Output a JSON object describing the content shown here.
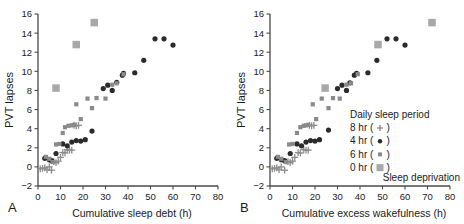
{
  "figure": {
    "background": "#ffffff",
    "axis_color": "#4a4a4a",
    "text_color": "#1a1a1a"
  },
  "series_styles": {
    "8hr": {
      "label": "8 hr",
      "marker": "plus",
      "color": "#8c8c8c",
      "size": 3.4
    },
    "4hr": {
      "label": "4 hr",
      "marker": "circle",
      "color": "#2b2b2b",
      "size": 2.6
    },
    "6hr": {
      "label": "6 hr",
      "marker": "square",
      "color": "#8a8a8a",
      "size": 4.2
    },
    "0hr": {
      "label": "0 hr",
      "marker": "square",
      "color": "#a8a8a8",
      "size": 7.5
    }
  },
  "panel_a": {
    "letter": "A",
    "chart_data": {
      "type": "scatter",
      "title": "",
      "xlabel": "Cumulative sleep debt (h)",
      "ylabel": "PVT lapses",
      "xlim": [
        0,
        80
      ],
      "ylim": [
        -2,
        16
      ],
      "xticks": [
        0,
        10,
        20,
        30,
        40,
        50,
        60,
        70,
        80
      ],
      "yticks": [
        -2,
        0,
        2,
        4,
        6,
        8,
        10,
        12,
        14,
        16
      ],
      "grid": false,
      "legend": "none",
      "series": [
        {
          "name": "8 hr",
          "marker": "plus",
          "color": "#8c8c8c",
          "points": [
            [
              1.0,
              -0.2
            ],
            [
              2.0,
              -0.15
            ],
            [
              3.0,
              -0.1
            ],
            [
              4.0,
              -0.3
            ],
            [
              5.0,
              0.0
            ],
            [
              6.0,
              -0.35
            ],
            [
              7.0,
              0.55
            ],
            [
              8.0,
              0.45
            ],
            [
              9.0,
              0.6
            ],
            [
              10.0,
              1.0
            ],
            [
              11.0,
              1.5
            ],
            [
              12.0,
              1.45
            ],
            [
              13.0,
              1.8
            ],
            [
              14.0,
              1.75
            ],
            [
              15.0,
              1.75
            ],
            [
              16.0,
              4.35
            ],
            [
              17.0,
              4.3
            ],
            [
              18.0,
              4.35
            ]
          ]
        },
        {
          "name": "4 hr",
          "marker": "circle",
          "color": "#2b2b2b",
          "points": [
            [
              3.0,
              0.9
            ],
            [
              5.0,
              0.75
            ],
            [
              6.0,
              0.65
            ],
            [
              8.0,
              1.4
            ],
            [
              11.0,
              2.4
            ],
            [
              13.0,
              2.2
            ],
            [
              15.0,
              2.6
            ],
            [
              17.0,
              2.75
            ],
            [
              19.0,
              2.7
            ],
            [
              21.0,
              2.85
            ],
            [
              24.0,
              3.75
            ],
            [
              29.0,
              8.2
            ],
            [
              31.0,
              8.55
            ],
            [
              33.0,
              8.0
            ],
            [
              35.0,
              8.85
            ],
            [
              37.5,
              9.6
            ],
            [
              38.0,
              9.8
            ],
            [
              43.0,
              9.85
            ],
            [
              47.0,
              11.15
            ],
            [
              52.0,
              13.4
            ],
            [
              56.0,
              13.4
            ],
            [
              60.0,
              12.75
            ]
          ]
        },
        {
          "name": "6 hr",
          "marker": "square",
          "color": "#8a8a8a",
          "points": [
            [
              3.5,
              1.05
            ],
            [
              5.0,
              0.85
            ],
            [
              6.5,
              0.5
            ],
            [
              8.0,
              2.35
            ],
            [
              9.5,
              2.4
            ],
            [
              11.0,
              3.55
            ],
            [
              12.0,
              4.15
            ],
            [
              13.5,
              4.3
            ],
            [
              15.0,
              4.35
            ],
            [
              16.0,
              4.4
            ],
            [
              17.0,
              6.55
            ],
            [
              19.0,
              5.0
            ],
            [
              22.0,
              7.15
            ],
            [
              24.0,
              6.15
            ],
            [
              26.0,
              7.2
            ],
            [
              30.0,
              7.15
            ],
            [
              33.0,
              8.6
            ],
            [
              35.0,
              8.75
            ],
            [
              38.0,
              9.7
            ]
          ]
        },
        {
          "name": "0 hr",
          "marker": "square",
          "color": "#a8a8a8",
          "points": [
            [
              8.0,
              8.25
            ],
            [
              17.0,
              12.8
            ],
            [
              25.0,
              15.1
            ]
          ]
        }
      ]
    }
  },
  "panel_b": {
    "letter": "B",
    "chart_data": {
      "type": "scatter",
      "title": "",
      "xlabel": "Cumulative excess wakefulness (h)",
      "ylabel": "PVT lapses",
      "xlim": [
        0,
        80
      ],
      "ylim": [
        -2,
        16
      ],
      "xticks": [
        0,
        10,
        20,
        30,
        40,
        50,
        60,
        70,
        80
      ],
      "yticks": [
        -2,
        0,
        2,
        4,
        6,
        8,
        10,
        12,
        14,
        16
      ],
      "grid": false,
      "legend": "inside-lower-right",
      "series": [
        {
          "name": "8 hr",
          "marker": "plus",
          "color": "#8c8c8c",
          "points": [
            [
              1.0,
              -0.2
            ],
            [
              2.0,
              -0.15
            ],
            [
              3.0,
              -0.1
            ],
            [
              4.0,
              -0.3
            ],
            [
              5.0,
              0.0
            ],
            [
              6.5,
              -0.35
            ],
            [
              8.0,
              0.55
            ],
            [
              9.0,
              0.45
            ],
            [
              10.0,
              0.6
            ],
            [
              11.0,
              1.0
            ],
            [
              12.5,
              1.5
            ],
            [
              13.5,
              1.45
            ],
            [
              15.0,
              1.8
            ],
            [
              16.0,
              1.75
            ],
            [
              17.0,
              1.75
            ],
            [
              17.5,
              4.35
            ],
            [
              18.5,
              4.3
            ],
            [
              19.5,
              4.35
            ]
          ]
        },
        {
          "name": "4 hr",
          "marker": "circle",
          "color": "#2b2b2b",
          "points": [
            [
              3.0,
              0.9
            ],
            [
              5.0,
              0.75
            ],
            [
              6.5,
              0.65
            ],
            [
              9.0,
              1.4
            ],
            [
              12.0,
              2.4
            ],
            [
              14.0,
              2.2
            ],
            [
              16.0,
              2.6
            ],
            [
              18.0,
              2.75
            ],
            [
              20.0,
              2.7
            ],
            [
              22.0,
              2.85
            ],
            [
              26.0,
              3.85
            ],
            [
              30.0,
              8.2
            ],
            [
              32.0,
              8.55
            ],
            [
              34.0,
              8.0
            ],
            [
              35.5,
              8.8
            ],
            [
              37.5,
              9.6
            ],
            [
              38.5,
              9.8
            ],
            [
              43.5,
              9.85
            ],
            [
              47.5,
              11.15
            ],
            [
              52.0,
              13.4
            ],
            [
              56.0,
              13.4
            ],
            [
              60.0,
              12.75
            ]
          ]
        },
        {
          "name": "6 hr",
          "marker": "square",
          "color": "#8a8a8a",
          "points": [
            [
              3.5,
              1.05
            ],
            [
              5.0,
              0.85
            ],
            [
              7.0,
              0.5
            ],
            [
              8.5,
              2.35
            ],
            [
              10.0,
              2.4
            ],
            [
              12.0,
              3.55
            ],
            [
              13.5,
              4.15
            ],
            [
              15.0,
              4.3
            ],
            [
              16.0,
              4.35
            ],
            [
              17.0,
              4.4
            ],
            [
              19.0,
              6.55
            ],
            [
              20.5,
              5.0
            ],
            [
              23.0,
              7.15
            ],
            [
              26.0,
              6.15
            ],
            [
              28.0,
              7.2
            ],
            [
              31.0,
              7.15
            ],
            [
              34.0,
              8.6
            ],
            [
              36.0,
              8.75
            ],
            [
              39.0,
              9.7
            ]
          ]
        },
        {
          "name": "0 hr",
          "marker": "square",
          "color": "#a8a8a8",
          "points": [
            [
              24.5,
              8.25
            ],
            [
              48.0,
              12.8
            ],
            [
              72.0,
              15.1
            ]
          ]
        }
      ]
    },
    "legend": {
      "title": "Daily sleep period",
      "items": [
        {
          "label": "8 hr",
          "glyph_open": "(",
          "glyph_close": ")",
          "marker": "plus"
        },
        {
          "label": "4 hr",
          "glyph_open": "(",
          "glyph_close": ")",
          "marker": "circle"
        },
        {
          "label": "6 hr",
          "glyph_open": "(",
          "glyph_close": ")",
          "marker": "square"
        },
        {
          "label": "0 hr",
          "glyph_open": "(",
          "glyph_close": ")",
          "marker": "bigsquare"
        }
      ],
      "footnote": "Sleep deprivation"
    }
  }
}
